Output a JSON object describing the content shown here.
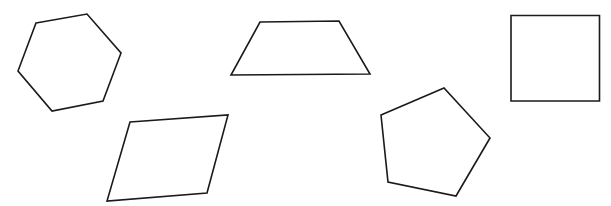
{
  "canvas": {
    "width": 611,
    "height": 206,
    "background": "#ffffff"
  },
  "style": {
    "stroke": "#1a1a1a",
    "fill": "none"
  },
  "shapes": [
    {
      "name": "hexagon",
      "points": "36,23 87,14 121,53 103,101 52,111 18,71"
    },
    {
      "name": "trapezoid",
      "points": "260,22 339,21 370,74 231,75"
    },
    {
      "name": "square",
      "points": "511,15.5 599.5,15.5 599.5,101 511,101"
    },
    {
      "name": "parallelogram",
      "points": "130,122 228,115 207,193 107,201"
    },
    {
      "name": "pentagon",
      "points": "381,115 444,88 490,138 456,196 388,182"
    }
  ]
}
